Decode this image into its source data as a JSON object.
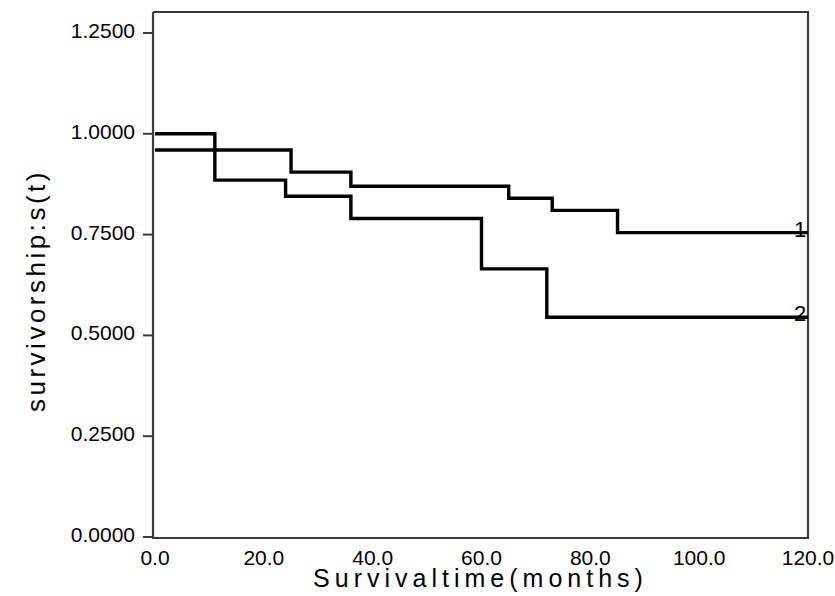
{
  "chart_data": {
    "type": "line",
    "subtype": "step",
    "title": "",
    "xlabel": "Survivaltime(months)",
    "ylabel": "survivorship:s(t)",
    "xlim": [
      0.0,
      120.0
    ],
    "ylim": [
      0.0,
      1.3125
    ],
    "xticks": [
      0.0,
      20.0,
      40.0,
      60.0,
      80.0,
      100.0,
      120.0
    ],
    "xtick_labels": [
      "0.0",
      "20.0",
      "40.0",
      "60.0",
      "80.0",
      "100.0",
      "120.0"
    ],
    "yticks": [
      0.0,
      0.25,
      0.5,
      0.75,
      1.0,
      1.25
    ],
    "ytick_labels": [
      "0.0000",
      "0.2500",
      "0.5000",
      "0.7500",
      "1.0000",
      "1.2500"
    ],
    "grid": false,
    "legend_position": "right-inline",
    "line_color": "#000000",
    "axis_color": "#3a3a3a",
    "background": "#ffffff",
    "series": [
      {
        "name": "1",
        "label": "1",
        "x": [
          0.0,
          11.0,
          25.0,
          36.0,
          65.0,
          73.0,
          85.0,
          120.0
        ],
        "y": [
          1.0,
          0.96,
          0.905,
          0.87,
          0.84,
          0.81,
          0.755,
          0.755
        ]
      },
      {
        "name": "2",
        "label": "2",
        "x": [
          0.0,
          11.0,
          24.0,
          36.0,
          60.0,
          72.0,
          120.0
        ],
        "y": [
          0.96,
          0.885,
          0.845,
          0.79,
          0.665,
          0.545,
          0.545
        ]
      }
    ]
  },
  "figure": {
    "series_end_labels": [
      "1",
      "2"
    ]
  }
}
